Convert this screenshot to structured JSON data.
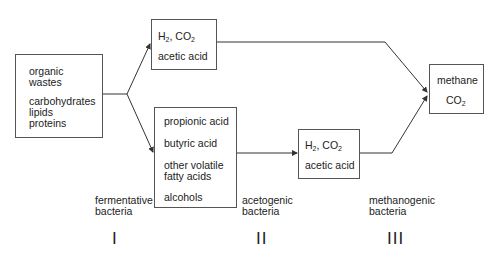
{
  "diagram": {
    "boxes": {
      "substrates": {
        "lines": [
          "organic",
          "wastes",
          "carbohydrates",
          "lipids",
          "proteins"
        ]
      },
      "top_products": {
        "gas": "H",
        "gas_sub": "2",
        "gas_sep": ", CO",
        "gas_sub2": "2",
        "acid": "acetic acid"
      },
      "intermediates": {
        "lines": [
          "propionic acid",
          "butyric acid",
          "other volatile",
          "fatty acids",
          "alcohols"
        ]
      },
      "acetogenic_products": {
        "gas": "H",
        "gas_sub": "2",
        "gas_sep": ", CO",
        "gas_sub2": "2",
        "acid": "acetic acid"
      },
      "final_products": {
        "line1": "methane",
        "co": "CO",
        "co_sub": "2"
      }
    },
    "stage_labels": [
      {
        "line1": "fermentative",
        "line2": "bacteria",
        "roman": "I"
      },
      {
        "line1": "acetogenic",
        "line2": "bacteria",
        "roman": "II"
      },
      {
        "line1": "methanogenic",
        "line2": "bacteria",
        "roman": "III"
      }
    ],
    "colors": {
      "line": "#333333",
      "border": "#555555",
      "text": "#222222"
    }
  }
}
